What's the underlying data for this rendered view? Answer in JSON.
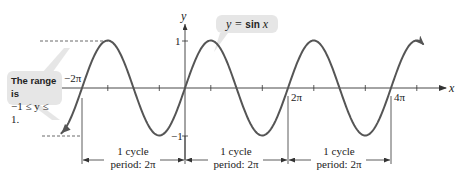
{
  "chart_data": {
    "type": "line",
    "title": "",
    "function": "y = sin x",
    "xlabel": "x",
    "ylabel": "y",
    "x_range": [
      "-2.4π",
      "4.7π"
    ],
    "ylim": [
      -1,
      1
    ],
    "x_tick_step": "π/2",
    "x_tick_labels": [
      "−2π",
      "2π",
      "4π"
    ],
    "y_tick_labels": [
      "1",
      "−1"
    ],
    "series": [
      {
        "name": "y = sin x",
        "x_pi_multiples": [
          -2.4,
          -2,
          -1.5,
          -1,
          -0.5,
          0,
          0.5,
          1,
          1.5,
          2,
          2.5,
          3,
          3.5,
          4,
          4.5,
          4.7
        ],
        "values": [
          -0.951,
          0,
          1,
          0,
          -1,
          0,
          1,
          0,
          -1,
          0,
          1,
          0,
          -1,
          0,
          1,
          0.809
        ]
      }
    ],
    "grid": false,
    "annotations": [
      "y = sin x",
      "The range is −1 ≤ y ≤ 1.",
      "1 cycle period: 2π (from −2π to 0)",
      "1 cycle period: 2π (from 0 to 2π)",
      "1 cycle period: 2π (from 2π to 4π)"
    ]
  },
  "axes": {
    "x_label": "x",
    "y_label": "y",
    "y_max_label": "1",
    "y_min_label": "−1",
    "x_labels": {
      "neg2pi": "−2π",
      "2pi": "2π",
      "4pi": "4π"
    }
  },
  "callouts": {
    "function": {
      "prefix": "y = ",
      "fn": "sin",
      "var": "x"
    },
    "range": {
      "line1": "The range is",
      "line2": "−1 ≤ y ≤ 1."
    }
  },
  "periods": [
    {
      "line1": "1 cycle",
      "line2": "period: 2π"
    },
    {
      "line1": "1 cycle",
      "line2": "period: 2π"
    },
    {
      "line1": "1 cycle",
      "line2": "period: 2π"
    }
  ],
  "colors": {
    "curve": "#555555",
    "axis": "#333333",
    "callout_bg": "#e6e6e6",
    "leader": "#d8d8d8"
  }
}
